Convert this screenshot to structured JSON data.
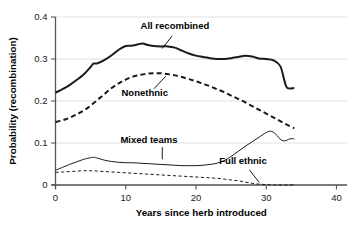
{
  "chart_data": {
    "type": "line",
    "title": "",
    "xlabel": "Years since herb introduced",
    "ylabel": "Probability (recombination)",
    "xlim": [
      0,
      41.5
    ],
    "ylim": [
      0,
      0.4
    ],
    "xticks": [
      0,
      10,
      20,
      30,
      40
    ],
    "xtick_labels": [
      "0",
      "10",
      "20",
      "30",
      "40"
    ],
    "yticks": [
      0,
      0.1,
      0.2,
      0.3,
      0.4
    ],
    "ytick_labels": [
      "0",
      "0.1",
      "0.2",
      "0.3",
      "0.4"
    ],
    "grid": "horizontal",
    "legend": "inline-annotations",
    "series": [
      {
        "name": "All recombined",
        "style": "solid-thick",
        "label": "All recombined",
        "label_x": 17.0,
        "label_y": 0.372,
        "leader": [
          [
            16.6,
            0.355
          ],
          [
            15.2,
            0.325
          ]
        ],
        "x": [
          0,
          1,
          2,
          3,
          4,
          5,
          5.4,
          6,
          7,
          8,
          9,
          10,
          11,
          12,
          12.5,
          13,
          14,
          15,
          16,
          17,
          18,
          19,
          20,
          21,
          22,
          23,
          24,
          25,
          26,
          27,
          28,
          29,
          30,
          31,
          32,
          32.6,
          33,
          34
        ],
        "y": [
          0.22,
          0.228,
          0.238,
          0.25,
          0.263,
          0.281,
          0.289,
          0.29,
          0.298,
          0.309,
          0.322,
          0.331,
          0.332,
          0.336,
          0.337,
          0.334,
          0.331,
          0.33,
          0.33,
          0.327,
          0.32,
          0.313,
          0.308,
          0.305,
          0.302,
          0.3,
          0.3,
          0.302,
          0.305,
          0.308,
          0.306,
          0.301,
          0.3,
          0.297,
          0.283,
          0.248,
          0.231,
          0.231
        ]
      },
      {
        "name": "Nonethnic",
        "style": "dashed-thick",
        "label": "Nonethnic",
        "label_x": 12.7,
        "label_y": 0.212,
        "leader": [
          [
            14.0,
            0.229
          ],
          [
            15.7,
            0.259
          ]
        ],
        "x": [
          0,
          1,
          2,
          3,
          4,
          5,
          6,
          7,
          8,
          9,
          10,
          11,
          12,
          13,
          14,
          15,
          16,
          17,
          18,
          19,
          20,
          21,
          22,
          23,
          24,
          25,
          26,
          27,
          28,
          29,
          30,
          31,
          32,
          33,
          34
        ],
        "y": [
          0.15,
          0.154,
          0.16,
          0.168,
          0.177,
          0.189,
          0.203,
          0.217,
          0.231,
          0.242,
          0.251,
          0.258,
          0.262,
          0.265,
          0.266,
          0.266,
          0.264,
          0.261,
          0.257,
          0.252,
          0.247,
          0.241,
          0.235,
          0.228,
          0.221,
          0.213,
          0.205,
          0.197,
          0.188,
          0.179,
          0.17,
          0.161,
          0.152,
          0.143,
          0.135
        ]
      },
      {
        "name": "Mixed teams",
        "style": "solid-thin",
        "label": "Mixed teams",
        "label_x": 13.3,
        "label_y": 0.101,
        "leader": [
          [
            15.2,
            0.09
          ],
          [
            15.2,
            0.061
          ]
        ],
        "x": [
          0,
          1,
          2,
          3,
          4,
          5,
          5.5,
          6,
          7,
          8,
          9,
          10,
          11,
          12,
          13,
          14,
          15,
          16,
          17,
          18,
          19,
          20,
          21,
          22,
          23,
          24,
          25,
          26,
          27,
          28,
          29,
          30,
          30.5,
          31,
          31.6,
          32,
          32.5,
          33,
          33.4,
          34
        ],
        "y": [
          0.035,
          0.042,
          0.049,
          0.055,
          0.061,
          0.065,
          0.066,
          0.064,
          0.059,
          0.056,
          0.054,
          0.053,
          0.053,
          0.052,
          0.051,
          0.05,
          0.049,
          0.048,
          0.047,
          0.046,
          0.046,
          0.046,
          0.047,
          0.049,
          0.052,
          0.058,
          0.068,
          0.08,
          0.092,
          0.103,
          0.114,
          0.125,
          0.128,
          0.126,
          0.117,
          0.109,
          0.105,
          0.107,
          0.11,
          0.11
        ]
      },
      {
        "name": "Full ethnic",
        "style": "dashed-thin",
        "label": "Full ethnic",
        "label_x": 26.7,
        "label_y": 0.049,
        "leader": [
          [
            27.6,
            0.036
          ],
          [
            29.0,
            0.006
          ]
        ],
        "x": [
          0,
          1,
          2,
          3,
          4,
          5,
          6,
          7,
          8,
          9,
          10,
          11,
          12,
          13,
          14,
          15,
          16,
          17,
          18,
          19,
          20,
          21,
          22,
          23,
          24,
          25,
          26,
          27,
          28,
          29,
          30,
          31,
          32,
          33,
          34
        ],
        "y": [
          0.03,
          0.031,
          0.032,
          0.033,
          0.034,
          0.034,
          0.033,
          0.032,
          0.031,
          0.03,
          0.029,
          0.028,
          0.027,
          0.026,
          0.025,
          0.024,
          0.023,
          0.022,
          0.021,
          0.02,
          0.019,
          0.018,
          0.017,
          0.016,
          0.014,
          0.012,
          0.01,
          0.007,
          0.004,
          0.002,
          0.001,
          0.0,
          0.0,
          0.0,
          0.0
        ]
      }
    ]
  },
  "colors": {
    "line": "#1a1a1a",
    "grid": "#d8d8d8",
    "axis": "#555555",
    "background": "#ffffff"
  }
}
